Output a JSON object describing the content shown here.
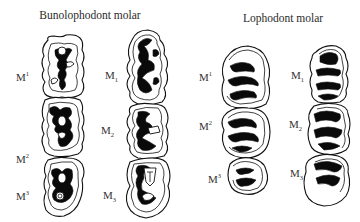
{
  "figure": {
    "panels": [
      {
        "title": "Bunolophodont molar",
        "upper_labels": [
          {
            "base": "M",
            "index": "1"
          },
          {
            "base": "M",
            "index": "2"
          },
          {
            "base": "M",
            "index": "3"
          }
        ],
        "lower_labels": [
          {
            "base": "M",
            "index": "1"
          },
          {
            "base": "M",
            "index": "2"
          },
          {
            "base": "M",
            "index": "3"
          }
        ]
      },
      {
        "title": "Lophodont molar",
        "upper_labels": [
          {
            "base": "M",
            "index": "1"
          },
          {
            "base": "M",
            "index": "2"
          },
          {
            "base": "M",
            "index": "3"
          }
        ],
        "lower_labels": [
          {
            "base": "M",
            "index": "1"
          },
          {
            "base": "M",
            "index": "2"
          },
          {
            "base": "M",
            "index": "3"
          }
        ]
      }
    ],
    "colors": {
      "ink": "#111111",
      "background": "#ffffff"
    }
  }
}
